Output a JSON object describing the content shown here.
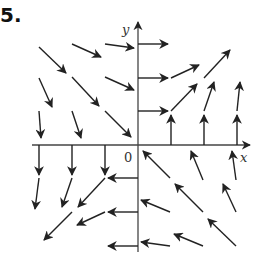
{
  "problem": {
    "number": "5."
  },
  "axes": {
    "x_label": "x",
    "y_label": "y",
    "origin_label": "0",
    "origin_px": [
      138,
      145
    ],
    "x_range_px": [
      32,
      250
    ],
    "y_range_px": [
      252,
      22
    ],
    "grid_step_px": 33,
    "color": "#222222"
  },
  "vectors": [
    {
      "x1": 39,
      "y1": 47,
      "x2": 66,
      "y2": 73
    },
    {
      "x1": 72,
      "y1": 44,
      "x2": 101,
      "y2": 57
    },
    {
      "x1": 105,
      "y1": 44,
      "x2": 134,
      "y2": 48
    },
    {
      "x1": 39,
      "y1": 78,
      "x2": 52,
      "y2": 107
    },
    {
      "x1": 72,
      "y1": 77,
      "x2": 99,
      "y2": 106
    },
    {
      "x1": 105,
      "y1": 77,
      "x2": 134,
      "y2": 90
    },
    {
      "x1": 39,
      "y1": 111,
      "x2": 41,
      "y2": 138
    },
    {
      "x1": 72,
      "y1": 111,
      "x2": 81,
      "y2": 138
    },
    {
      "x1": 105,
      "y1": 111,
      "x2": 131,
      "y2": 137
    },
    {
      "x1": 138,
      "y1": 44,
      "x2": 168,
      "y2": 44
    },
    {
      "x1": 138,
      "y1": 78,
      "x2": 168,
      "y2": 78
    },
    {
      "x1": 171,
      "y1": 78,
      "x2": 199,
      "y2": 65
    },
    {
      "x1": 204,
      "y1": 78,
      "x2": 230,
      "y2": 50
    },
    {
      "x1": 138,
      "y1": 111,
      "x2": 168,
      "y2": 111
    },
    {
      "x1": 171,
      "y1": 111,
      "x2": 197,
      "y2": 84
    },
    {
      "x1": 204,
      "y1": 111,
      "x2": 214,
      "y2": 82
    },
    {
      "x1": 237,
      "y1": 111,
      "x2": 240,
      "y2": 82
    },
    {
      "x1": 171,
      "y1": 145,
      "x2": 171,
      "y2": 115
    },
    {
      "x1": 204,
      "y1": 145,
      "x2": 204,
      "y2": 115
    },
    {
      "x1": 237,
      "y1": 145,
      "x2": 237,
      "y2": 115
    },
    {
      "x1": 39,
      "y1": 145,
      "x2": 39,
      "y2": 175
    },
    {
      "x1": 72,
      "y1": 145,
      "x2": 72,
      "y2": 175
    },
    {
      "x1": 105,
      "y1": 145,
      "x2": 105,
      "y2": 175
    },
    {
      "x1": 39,
      "y1": 178,
      "x2": 35,
      "y2": 209
    },
    {
      "x1": 72,
      "y1": 178,
      "x2": 62,
      "y2": 207
    },
    {
      "x1": 105,
      "y1": 178,
      "x2": 78,
      "y2": 207
    },
    {
      "x1": 138,
      "y1": 178,
      "x2": 108,
      "y2": 178
    },
    {
      "x1": 72,
      "y1": 212,
      "x2": 44,
      "y2": 240
    },
    {
      "x1": 105,
      "y1": 212,
      "x2": 77,
      "y2": 225
    },
    {
      "x1": 138,
      "y1": 212,
      "x2": 108,
      "y2": 212
    },
    {
      "x1": 138,
      "y1": 246,
      "x2": 108,
      "y2": 246
    },
    {
      "x1": 170,
      "y1": 178,
      "x2": 143,
      "y2": 151
    },
    {
      "x1": 203,
      "y1": 180,
      "x2": 191,
      "y2": 151
    },
    {
      "x1": 236,
      "y1": 180,
      "x2": 232,
      "y2": 151
    },
    {
      "x1": 170,
      "y1": 212,
      "x2": 141,
      "y2": 200
    },
    {
      "x1": 203,
      "y1": 212,
      "x2": 175,
      "y2": 184
    },
    {
      "x1": 236,
      "y1": 212,
      "x2": 223,
      "y2": 184
    },
    {
      "x1": 170,
      "y1": 246,
      "x2": 141,
      "y2": 242
    },
    {
      "x1": 203,
      "y1": 246,
      "x2": 174,
      "y2": 234
    },
    {
      "x1": 236,
      "y1": 246,
      "x2": 208,
      "y2": 219
    }
  ]
}
